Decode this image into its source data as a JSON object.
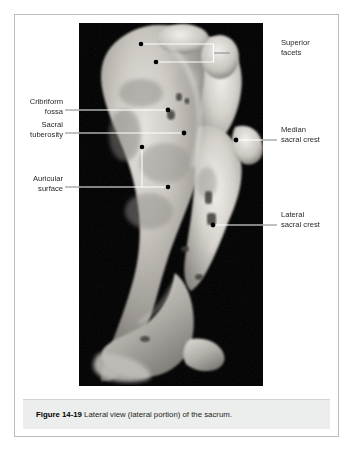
{
  "figure": {
    "caption_number": "Figure 14-19",
    "caption_text": " Lateral view (lateral portion) of the sacrum.",
    "image_description": "Grayscale photograph of a human sacrum, lateral view of the lateral portion, on a black background"
  },
  "labels": {
    "superior_facets": "Superior\nfacets",
    "cribriform_fossa": "Cribriform\nfossa",
    "sacral_tuberosity": "Sacral\ntuberosity",
    "auricular_surface": "Auricular\nsurface",
    "median_sacral_crest": "Median\nsacral crest",
    "lateral_sacral_crest": "Lateral\nsacral crest"
  },
  "colors": {
    "leader_on_photo": "#ffffff",
    "leader_off_photo": "#8a8c8e",
    "marker_dot": "#000000",
    "text": "#231f20",
    "frame_border": "#b9bdc0",
    "caption_background": "#eceded",
    "photo_background": "#000000"
  }
}
